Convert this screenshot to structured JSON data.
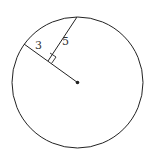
{
  "diagram": {
    "type": "geometry",
    "labels": {
      "radius_segment": "3",
      "perpendicular_segment": "5"
    },
    "colors": {
      "stroke": "#222222",
      "background": "#ffffff"
    }
  }
}
